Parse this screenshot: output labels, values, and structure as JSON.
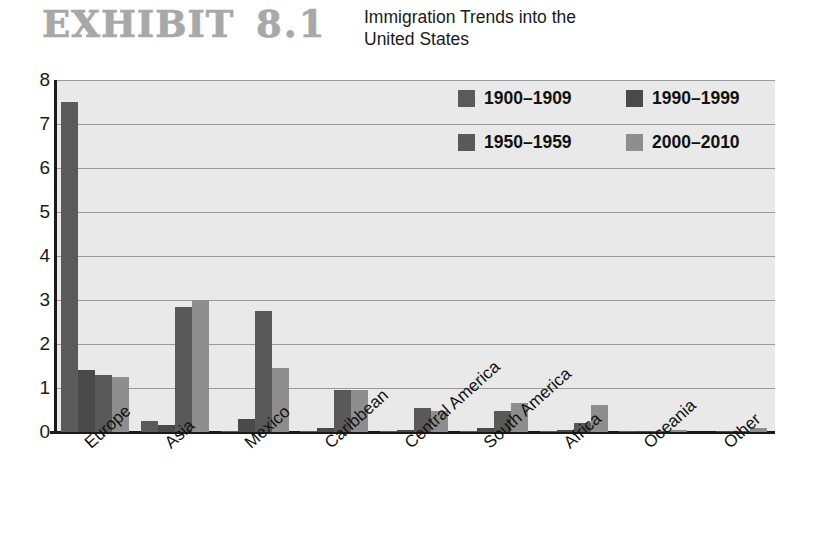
{
  "header": {
    "exhibit_label": "EXHIBIT",
    "exhibit_number": "8.1",
    "subtitle_line1": "Immigration Trends into the",
    "subtitle_line2": "United States"
  },
  "legend": {
    "position": "inside-top-right",
    "items": [
      {
        "label": "1900–1909",
        "color": "#5a5a5a"
      },
      {
        "label": "1990–1999",
        "color": "#4a4a4a"
      },
      {
        "label": "1950–1959",
        "color": "#595959"
      },
      {
        "label": "2000–2010",
        "color": "#8e8e8e"
      }
    ]
  },
  "axes": {
    "y_ticks": [
      "8",
      "7",
      "6",
      "5",
      "4",
      "3",
      "2",
      "1",
      "0"
    ],
    "x_ticks": [
      "Europe",
      "Asia",
      "Mexico",
      "Caribbean",
      "Central America",
      "South America",
      "Africa",
      "Oceania",
      "Other"
    ]
  },
  "chart_data": {
    "type": "bar",
    "title": "Immigration Trends into the United States",
    "xlabel": "",
    "ylabel": "",
    "ylim": [
      0,
      8
    ],
    "yticks": [
      0,
      1,
      2,
      3,
      4,
      5,
      6,
      7,
      8
    ],
    "grid": true,
    "legend_position": "inside-top-right",
    "categories": [
      "Europe",
      "Asia",
      "Mexico",
      "Caribbean",
      "Central America",
      "South America",
      "Africa",
      "Oceania",
      "Other"
    ],
    "series": [
      {
        "name": "1900–1909",
        "color": "#5a5a5a",
        "values": [
          7.5,
          0.25,
          0.03,
          0.02,
          0.01,
          0.02,
          0.01,
          0.01,
          0.0
        ]
      },
      {
        "name": "1950–1959",
        "color": "#4a4a4a",
        "values": [
          1.4,
          0.15,
          0.3,
          0.08,
          0.05,
          0.08,
          0.05,
          0.02,
          0.01
        ]
      },
      {
        "name": "1990–1999",
        "color": "#595959",
        "values": [
          1.3,
          2.85,
          2.75,
          0.95,
          0.55,
          0.48,
          0.2,
          0.03,
          0.02
        ]
      },
      {
        "name": "2000–2010",
        "color": "#8e8e8e",
        "values": [
          1.25,
          3.0,
          1.45,
          0.95,
          0.47,
          0.65,
          0.62,
          0.05,
          0.1
        ]
      }
    ]
  }
}
